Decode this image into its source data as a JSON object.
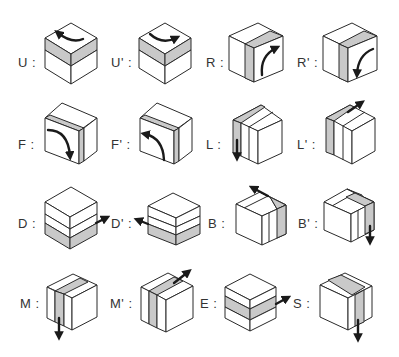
{
  "diagram": {
    "style": {
      "shade_color": "#c9c9c9",
      "line_color": "#2a2a2a",
      "background": "#ffffff"
    },
    "moves": [
      {
        "id": "U",
        "label": "U :",
        "layer": "top",
        "direction": "counterclockwise"
      },
      {
        "id": "U'",
        "label": "U' :",
        "layer": "top",
        "direction": "clockwise"
      },
      {
        "id": "R",
        "label": "R :",
        "layer": "right",
        "direction": "up"
      },
      {
        "id": "R'",
        "label": "R' :",
        "layer": "right",
        "direction": "down"
      },
      {
        "id": "F",
        "label": "F :",
        "layer": "front",
        "direction": "clockwise"
      },
      {
        "id": "F'",
        "label": "F' :",
        "layer": "front",
        "direction": "counterclockwise"
      },
      {
        "id": "L",
        "label": "L :",
        "layer": "left",
        "direction": "down"
      },
      {
        "id": "L'",
        "label": "L' :",
        "layer": "left",
        "direction": "up"
      },
      {
        "id": "D",
        "label": "D :",
        "layer": "bottom",
        "direction": "right"
      },
      {
        "id": "D'",
        "label": "D' :",
        "layer": "bottom",
        "direction": "left"
      },
      {
        "id": "B",
        "label": "B :",
        "layer": "back",
        "direction": "up"
      },
      {
        "id": "B'",
        "label": "B' :",
        "layer": "back",
        "direction": "down"
      },
      {
        "id": "M",
        "label": "M :",
        "layer": "middle",
        "direction": "down"
      },
      {
        "id": "M'",
        "label": "M' :",
        "layer": "middle",
        "direction": "up"
      },
      {
        "id": "E",
        "label": "E :",
        "layer": "equator",
        "direction": "right"
      },
      {
        "id": "S",
        "label": "S :",
        "layer": "standing",
        "direction": "down"
      }
    ]
  }
}
